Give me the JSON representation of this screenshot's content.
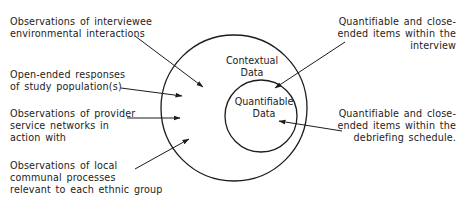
{
  "diagram": {
    "circles": {
      "outer": {
        "label_lines": [
          "Contextual",
          "Data"
        ]
      },
      "inner": {
        "label_lines": [
          "Quantifiable",
          "Data"
        ]
      }
    },
    "left_labels": [
      {
        "lines": [
          "Observations of interviewee",
          "environmental interactions"
        ],
        "points_to": "outer"
      },
      {
        "lines": [
          "Open-ended responses",
          "of study population(s)"
        ],
        "points_to": "outer"
      },
      {
        "lines": [
          "Observations of provider",
          "service networks in",
          "action with"
        ],
        "points_to": "outer"
      },
      {
        "lines": [
          "Observations of local",
          "communal processes",
          "relevant to each ethnic group"
        ],
        "points_to": "outer"
      }
    ],
    "right_labels": [
      {
        "lines": [
          "Quantifiable and close-",
          "ended items within the",
          "interview"
        ],
        "points_to": "inner"
      },
      {
        "lines": [
          "Quantifiable and close-",
          "ended items within the",
          "debriefing schedule."
        ],
        "points_to": "inner"
      }
    ],
    "colors": {
      "stroke": "#1c1c1c",
      "text": "#1c1c1c",
      "background": "#ffffff"
    }
  }
}
